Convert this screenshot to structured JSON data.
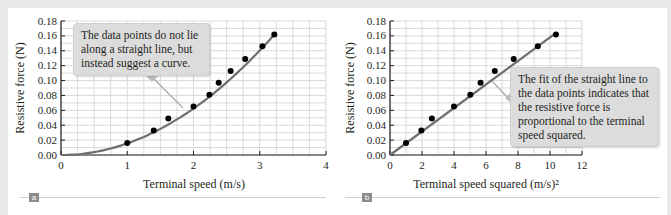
{
  "figure": {
    "panels": [
      {
        "id": "a",
        "badge": "a",
        "callout": "The data points do not lie along a straight line, but instead suggest a curve."
      },
      {
        "id": "b",
        "badge": "b",
        "callout": "The fit of the straight line to the data points indicates that the resistive force is proportional to the terminal speed squared."
      }
    ]
  },
  "chart_data": [
    {
      "type": "scatter",
      "title": "",
      "xlabel": "Terminal speed (m/s)",
      "ylabel": "Resistive force (N)",
      "xlim": [
        0,
        4
      ],
      "ylim": [
        0,
        0.18
      ],
      "x_ticks": [
        "0",
        "1",
        "2",
        "3",
        "4"
      ],
      "y_ticks": [
        "0.00",
        "0.02",
        "0.04",
        "0.06",
        "0.08",
        "0.10",
        "0.12",
        "0.14",
        "0.16",
        "0.18"
      ],
      "grid": true,
      "series": [
        {
          "name": "data",
          "x": [
            1.0,
            1.4,
            1.62,
            2.0,
            2.24,
            2.38,
            2.56,
            2.78,
            3.04,
            3.22
          ],
          "y": [
            0.016,
            0.033,
            0.049,
            0.065,
            0.081,
            0.097,
            0.113,
            0.129,
            0.146,
            0.162
          ]
        },
        {
          "name": "fit curve (quadratic)",
          "style": "line",
          "x_range": [
            0,
            3.22
          ]
        }
      ],
      "annotation": "The data points do not lie along a straight line, but instead suggest a curve."
    },
    {
      "type": "scatter",
      "title": "",
      "xlabel": "Terminal speed squared (m/s)²",
      "ylabel": "Resistive force (N)",
      "xlim": [
        0,
        12
      ],
      "ylim": [
        0,
        0.18
      ],
      "x_ticks": [
        "0",
        "2",
        "4",
        "6",
        "8",
        "10",
        "12"
      ],
      "y_ticks": [
        "0.00",
        "0.02",
        "0.04",
        "0.06",
        "0.08",
        "0.10",
        "0.12",
        "0.14",
        "0.16",
        "0.18"
      ],
      "grid": true,
      "series": [
        {
          "name": "data",
          "x": [
            1.0,
            1.96,
            2.62,
            4.0,
            5.02,
            5.66,
            6.55,
            7.73,
            9.24,
            10.37
          ],
          "y": [
            0.016,
            0.033,
            0.049,
            0.065,
            0.081,
            0.097,
            0.113,
            0.129,
            0.146,
            0.162
          ]
        },
        {
          "name": "fit line",
          "style": "line",
          "x_range": [
            0,
            10.4
          ]
        }
      ],
      "annotation": "The fit of the straight line to the data points indicates that the resistive force is proportional to the terminal speed squared."
    }
  ]
}
